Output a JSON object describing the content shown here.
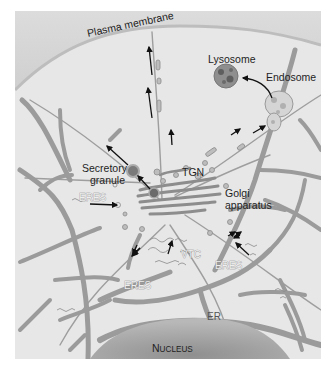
{
  "figure": {
    "labels": {
      "plasma_membrane": "Plasma membrane",
      "lysosome": "Lysosome",
      "endosome": "Endosome",
      "secretory_granule_line1": "Secretory",
      "secretory_granule_line2": "granule",
      "tgn": "TGN",
      "golgi_line1": "Golgi",
      "golgi_line2": "apparatus",
      "eres_left": "ERES",
      "eres_center": "ERES",
      "eres_right": "ERES",
      "vtc": "VTC",
      "er": "ER",
      "nucleus_first": "N",
      "nucleus_rest": "UCLEUS"
    },
    "colors": {
      "background": "#ffffff",
      "cytoplasm": "#e6e6e6",
      "extracellular": "#d4d4d4",
      "membrane": "#b5b5b5",
      "er": "#9b9b9b",
      "nucleus": "#a9a9a9",
      "arrow": "#111111"
    }
  }
}
